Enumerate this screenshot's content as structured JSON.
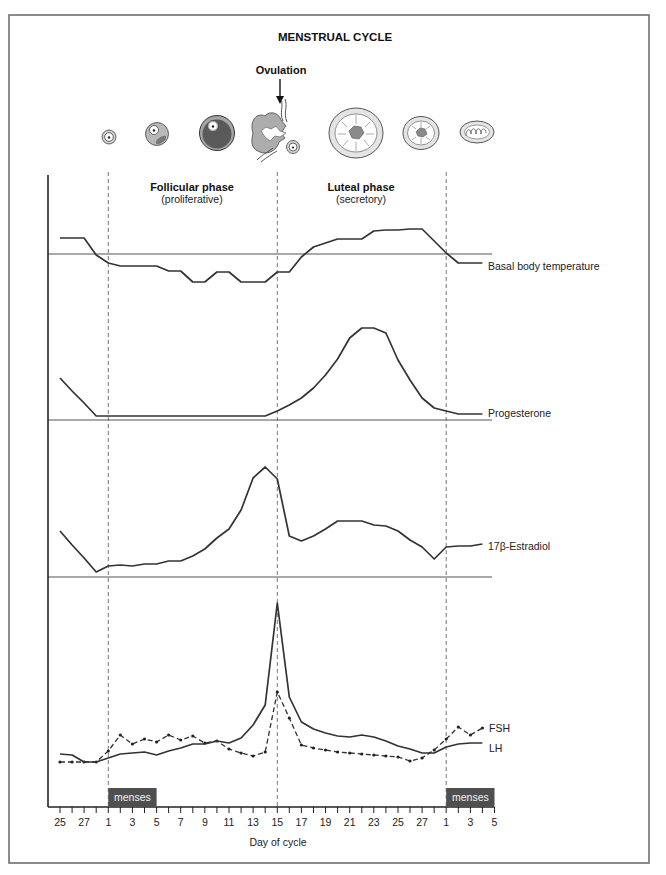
{
  "figure": {
    "ovulation_label": "Ovulation",
    "phases": [
      {
        "name": "Follicular phase",
        "subtitle": "(proliferative)"
      },
      {
        "name": "Luteal phase",
        "subtitle": "(secretory)"
      }
    ],
    "menses_label": "menses",
    "follicle_icons": [
      "primordial-follicle-icon",
      "primary-follicle-icon",
      "antral-follicle-icon",
      "ruptured-follicle-oocyte-icon",
      "corpus-luteum-icon",
      "regressing-corpus-luteum-icon",
      "corpus-albicans-icon"
    ],
    "colors": {
      "line": "#333333",
      "menses_box": "#4f4f4f",
      "frame": "#6f6f6f"
    }
  },
  "chart_data": {
    "type": "line",
    "title": "MENSTRUAL CYCLE",
    "xlabel": "Day of cycle",
    "ylabel": "",
    "y_units": "relative (no y-axis scale shown)",
    "x": [
      25,
      26,
      27,
      28,
      1,
      2,
      3,
      4,
      5,
      6,
      7,
      8,
      9,
      10,
      11,
      12,
      13,
      14,
      15,
      16,
      17,
      18,
      19,
      20,
      21,
      22,
      23,
      24,
      25,
      26,
      27,
      28,
      1,
      2,
      3,
      4
    ],
    "tick_labels": [
      "25",
      "27",
      "1",
      "3",
      "5",
      "7",
      "9",
      "11",
      "13",
      "15",
      "17",
      "19",
      "21",
      "23",
      "25",
      "27",
      "1",
      "3",
      "5"
    ],
    "tick_count": 37,
    "grid": false,
    "legend": "inline labels at right end of each series",
    "vertical_markers": [
      {
        "day": 1,
        "index": 4
      },
      {
        "day": 15,
        "index": 18,
        "label": "Ovulation"
      },
      {
        "day": 1,
        "index": 32
      }
    ],
    "menses": [
      {
        "label": "menses",
        "start_index": 4,
        "end_index": 8
      },
      {
        "label": "menses",
        "start_index": 32,
        "end_index": 36
      }
    ],
    "series": [
      {
        "key": "bbt",
        "name": "Basal body temperature",
        "style": "solid",
        "values": [
          16,
          16,
          16,
          -1,
          -9,
          -12,
          -12,
          -12,
          -12,
          -17,
          -17,
          -28,
          -28,
          -18,
          -18,
          -28,
          -28,
          -28,
          -18,
          -18,
          -3,
          7,
          11,
          15,
          15,
          15,
          23,
          24,
          24,
          25,
          25,
          13,
          1,
          -9,
          -9,
          -9
        ]
      },
      {
        "key": "prog",
        "name": "Progesterone",
        "style": "solid",
        "values": [
          42,
          29,
          17,
          4,
          4,
          4,
          4,
          4,
          4,
          4,
          4,
          4,
          4,
          4,
          4,
          4,
          4,
          4,
          9,
          15,
          22,
          32,
          45,
          61,
          82,
          92,
          92,
          87,
          60,
          40,
          22,
          12,
          9,
          6,
          6,
          6
        ]
      },
      {
        "key": "e2",
        "name": "17β-Estradiol",
        "style": "solid",
        "values": [
          46,
          32,
          19,
          5,
          11,
          12,
          11,
          13,
          13,
          16,
          16,
          21,
          28,
          39,
          48,
          67,
          99,
          110,
          98,
          41,
          36,
          41,
          48,
          56,
          56,
          56,
          52,
          51,
          46,
          37,
          30,
          18,
          30,
          31,
          31,
          33
        ]
      },
      {
        "key": "fsh",
        "name": "FSH",
        "style": "dashed",
        "markers": true,
        "values": [
          45,
          45,
          45,
          45,
          56,
          72,
          63,
          68,
          65,
          72,
          67,
          71,
          64,
          66,
          58,
          54,
          51,
          55,
          115,
          89,
          62,
          59,
          57,
          55,
          54,
          53,
          52,
          51,
          50,
          46,
          49,
          57,
          68,
          80,
          72,
          79
        ]
      },
      {
        "key": "lh",
        "name": "LH",
        "style": "solid",
        "values": [
          53,
          52,
          45,
          45,
          49,
          53,
          54,
          55,
          52,
          56,
          59,
          63,
          63,
          66,
          64,
          69,
          82,
          102,
          204,
          110,
          85,
          78,
          74,
          71,
          70,
          72,
          70,
          66,
          61,
          58,
          54,
          54,
          60,
          63,
          64,
          64
        ]
      }
    ]
  }
}
